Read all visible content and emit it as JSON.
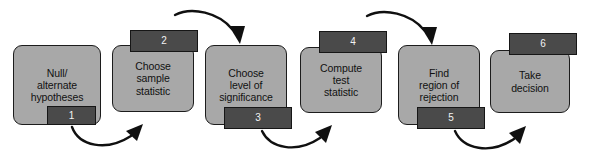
{
  "diagram": {
    "background_color": "#ffffff",
    "node_fill_color": "#a8a8a8",
    "node_border_color": "#1c1c1c",
    "tab_fill_color": "#4a4a4a",
    "tab_text_color": "#f2f2f2",
    "arrow_color": "#101010",
    "steps": [
      {
        "number": "1",
        "label": "Null/\nalternate\nhypotheses",
        "tab_position": "bottom-left"
      },
      {
        "number": "2",
        "label": "Choose\nsample\nstatistic",
        "tab_position": "top-left"
      },
      {
        "number": "3",
        "label": "Choose\nlevel of\nsignificance",
        "tab_position": "bottom-left"
      },
      {
        "number": "4",
        "label": "Compute\ntest\nstatistic",
        "tab_position": "top-left"
      },
      {
        "number": "5",
        "label": "Find\nregion of\nrejection",
        "tab_position": "bottom-left"
      },
      {
        "number": "6",
        "label": "Take\ndecision",
        "tab_position": "top-left"
      }
    ],
    "connectors": [
      {
        "from": "1",
        "to": "2",
        "position": "below",
        "direction": "up-right"
      },
      {
        "from": "2",
        "to": "3",
        "position": "above",
        "direction": "down-right"
      },
      {
        "from": "3",
        "to": "4",
        "position": "below",
        "direction": "up-right"
      },
      {
        "from": "4",
        "to": "5",
        "position": "above",
        "direction": "down-right"
      },
      {
        "from": "5",
        "to": "6",
        "position": "below",
        "direction": "up-right"
      }
    ]
  }
}
